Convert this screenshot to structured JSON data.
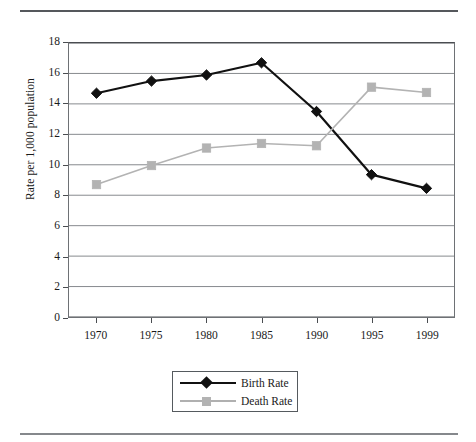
{
  "figure": {
    "y_axis_title": "Rate per 1,000 population",
    "rules": {
      "top": "horizontal-rule",
      "bottom": "horizontal-rule"
    }
  },
  "legend": {
    "position": "bottom-center",
    "entries": [
      {
        "label": "Birth Rate",
        "marker": "diamond",
        "color": "#111111"
      },
      {
        "label": "Death Rate",
        "marker": "square",
        "color": "#b3b3b3"
      }
    ]
  },
  "chart_data": {
    "type": "line",
    "title": "",
    "xlabel": "",
    "ylabel": "Rate per 1,000 population",
    "categories": [
      "1970",
      "1975",
      "1980",
      "1985",
      "1990",
      "1995",
      "1999"
    ],
    "xtick_labels": [
      "1970",
      "1975",
      "1980",
      "1985",
      "1990",
      "1995",
      "1999"
    ],
    "ytick_labels": [
      "0",
      "2",
      "4",
      "6",
      "8",
      "10",
      "12",
      "14",
      "16",
      "18"
    ],
    "yticks": [
      0,
      2,
      4,
      6,
      8,
      10,
      12,
      14,
      16,
      18
    ],
    "ylim": [
      0,
      18
    ],
    "grid": "horizontal",
    "legend_position": "bottom-center",
    "series": [
      {
        "name": "Birth Rate",
        "marker": "diamond",
        "color": "#111111",
        "values": [
          14.7,
          15.5,
          15.9,
          16.7,
          13.5,
          9.35,
          8.45
        ]
      },
      {
        "name": "Death Rate",
        "marker": "square",
        "color": "#b3b3b3",
        "values": [
          8.7,
          9.95,
          11.1,
          11.4,
          11.25,
          15.1,
          14.75
        ]
      }
    ]
  }
}
